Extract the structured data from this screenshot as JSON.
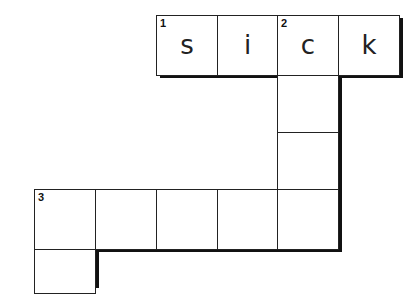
{
  "puzzle": {
    "cells": [
      {
        "id": "r0c0",
        "number": "1",
        "letter": "s"
      },
      {
        "id": "r0c1",
        "number": "",
        "letter": "i"
      },
      {
        "id": "r0c2",
        "number": "2",
        "letter": "c"
      },
      {
        "id": "r0c3",
        "number": "",
        "letter": "k"
      },
      {
        "id": "d1",
        "number": "",
        "letter": ""
      },
      {
        "id": "d2",
        "number": "",
        "letter": ""
      },
      {
        "id": "r3c0",
        "number": "3",
        "letter": ""
      },
      {
        "id": "r3c1",
        "number": "",
        "letter": ""
      },
      {
        "id": "r3c2",
        "number": "",
        "letter": ""
      },
      {
        "id": "r3c3",
        "number": "",
        "letter": ""
      },
      {
        "id": "r3c4",
        "number": "",
        "letter": ""
      },
      {
        "id": "r4c0",
        "number": "",
        "letter": ""
      }
    ]
  }
}
